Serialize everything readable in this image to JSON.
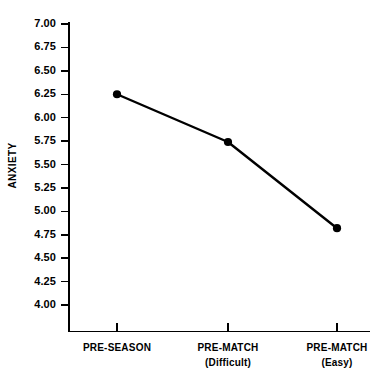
{
  "chart_data": {
    "type": "line",
    "title": "",
    "xlabel": "",
    "ylabel": "ANXIETY",
    "categories": [
      "PRE-SEASON",
      "PRE-MATCH (Difficult)",
      "PRE-MATCH (Easy)"
    ],
    "category_lines": [
      {
        "main": "PRE-SEASON",
        "sub": ""
      },
      {
        "main": "PRE-MATCH",
        "sub": "(Difficult)"
      },
      {
        "main": "PRE-MATCH",
        "sub": "(Easy)"
      }
    ],
    "values": [
      6.25,
      5.74,
      4.82
    ],
    "series": [
      {
        "name": "Anxiety",
        "values": [
          6.25,
          5.74,
          4.82
        ]
      }
    ],
    "ylim": [
      4.0,
      7.0
    ],
    "ytick_step": 0.25,
    "ytick_labels": [
      "7.00",
      "6.75",
      "6.50",
      "6.25",
      "6.00",
      "5.75",
      "5.50",
      "5.25",
      "5.00",
      "4.75",
      "4.50",
      "4.25",
      "4.00"
    ],
    "ytick_values": [
      7.0,
      6.75,
      6.5,
      6.25,
      6.0,
      5.75,
      5.5,
      5.25,
      5.0,
      4.75,
      4.5,
      4.25,
      4.0
    ],
    "grid": false,
    "legend": "none",
    "marker": "filled-circle",
    "line_color": "#000000",
    "marker_color": "#000000",
    "background_color": "#ffffff",
    "axis_color": "#000000"
  }
}
